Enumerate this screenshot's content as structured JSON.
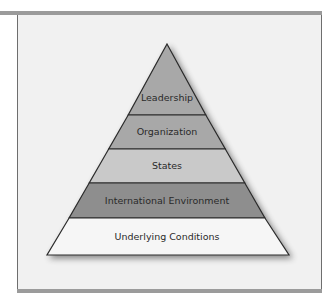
{
  "diagram": {
    "type": "pyramid",
    "levels": [
      {
        "label": "Leadership",
        "fill": "#a8a8a8"
      },
      {
        "label": "Organization",
        "fill": "#a8a8a8"
      },
      {
        "label": "States",
        "fill": "#c9c9c9"
      },
      {
        "label": "International Environment",
        "fill": "#8e8e8e"
      },
      {
        "label": "Underlying Conditions",
        "fill": "#f6f6f6"
      }
    ]
  }
}
